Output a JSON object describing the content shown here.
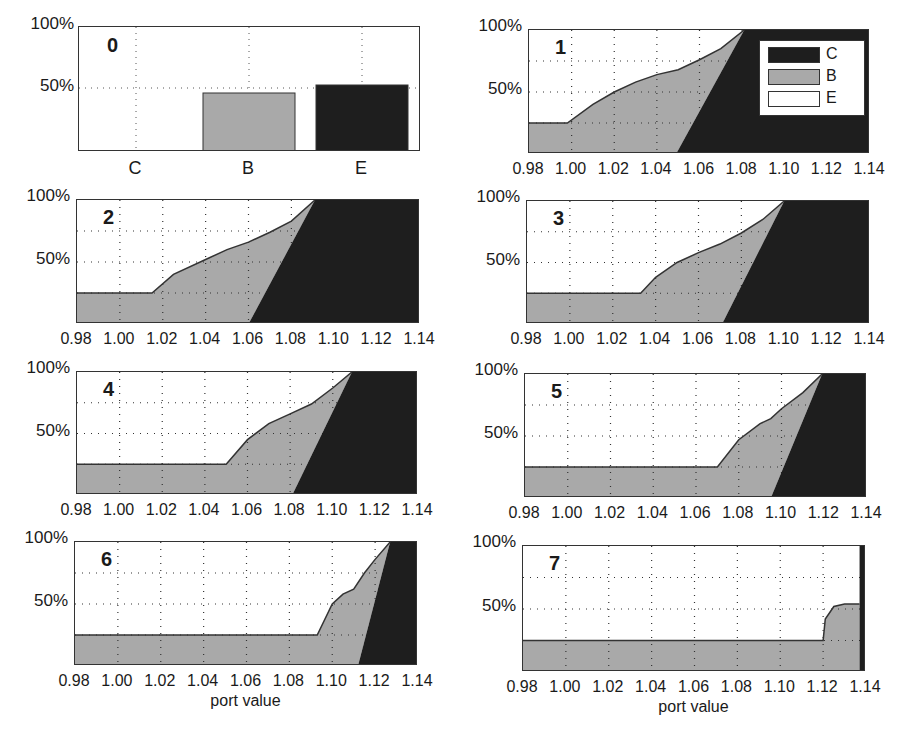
{
  "colors": {
    "C": "#1e1e1e",
    "B": "#a9a9a9",
    "E": "#ffffff",
    "grid": "#333333"
  },
  "y_ticks": [
    "100%",
    "50%"
  ],
  "x_ticks": [
    "0.98",
    "1.00",
    "1.02",
    "1.04",
    "1.06",
    "1.08",
    "1.10",
    "1.12",
    "1.14"
  ],
  "x_axis_label": "port value",
  "legend": [
    {
      "key": "C",
      "label": "C"
    },
    {
      "key": "B",
      "label": "B"
    },
    {
      "key": "E",
      "label": "E"
    }
  ],
  "panels": [
    {
      "id": "0",
      "label": "0"
    },
    {
      "id": "1",
      "label": "1"
    },
    {
      "id": "2",
      "label": "2"
    },
    {
      "id": "3",
      "label": "3"
    },
    {
      "id": "4",
      "label": "4"
    },
    {
      "id": "5",
      "label": "5"
    },
    {
      "id": "6",
      "label": "6"
    },
    {
      "id": "7",
      "label": "7"
    }
  ],
  "chart_data": [
    {
      "panel": "0",
      "type": "bar",
      "title": "0",
      "categories": [
        "C",
        "B",
        "E"
      ],
      "values": [
        0,
        46,
        54
      ],
      "colors": [
        "#1e1e1e",
        "#a9a9a9",
        "#1e1e1e"
      ],
      "ylabel": "",
      "ylim": [
        0,
        100
      ],
      "yticks": [
        "50%",
        "100%"
      ],
      "grid": true
    },
    {
      "panel": "1",
      "type": "area",
      "title": "1",
      "xlim": [
        0.98,
        1.14
      ],
      "ylim": [
        0,
        100
      ],
      "xticks": [
        0.98,
        1.0,
        1.02,
        1.04,
        1.06,
        1.08,
        1.1,
        1.12,
        1.14
      ],
      "yticks": [
        "50%",
        "100%"
      ],
      "series": [
        {
          "name": "B upper (C+B cumulative)",
          "x": [
            0.98,
            0.998,
            1.01,
            1.02,
            1.03,
            1.04,
            1.05,
            1.06,
            1.07,
            1.081
          ],
          "values": [
            25,
            25,
            40,
            50,
            58,
            64,
            68,
            76,
            85,
            100
          ]
        },
        {
          "name": "C boundary",
          "x": [
            1.049,
            1.081
          ],
          "values": [
            0,
            100
          ]
        }
      ],
      "legend": [
        "C",
        "B",
        "E"
      ],
      "legend_position": "upper right",
      "grid": true
    },
    {
      "panel": "2",
      "type": "area",
      "title": "2",
      "xlim": [
        0.98,
        1.14
      ],
      "ylim": [
        0,
        100
      ],
      "series": [
        {
          "name": "B upper",
          "x": [
            0.98,
            1.015,
            1.025,
            1.04,
            1.05,
            1.06,
            1.07,
            1.08,
            1.091
          ],
          "values": [
            25,
            25,
            40,
            52,
            60,
            66,
            74,
            83,
            100
          ]
        },
        {
          "name": "C boundary",
          "x": [
            1.06,
            1.091
          ],
          "values": [
            0,
            100
          ]
        }
      ],
      "grid": true
    },
    {
      "panel": "3",
      "type": "area",
      "title": "3",
      "xlim": [
        0.98,
        1.14
      ],
      "ylim": [
        0,
        100
      ],
      "series": [
        {
          "name": "B upper",
          "x": [
            0.98,
            1.033,
            1.04,
            1.05,
            1.06,
            1.07,
            1.08,
            1.09,
            1.1
          ],
          "values": [
            25,
            25,
            38,
            50,
            58,
            65,
            74,
            85,
            100
          ]
        },
        {
          "name": "C boundary",
          "x": [
            1.071,
            1.1
          ],
          "values": [
            0,
            100
          ]
        }
      ],
      "grid": true
    },
    {
      "panel": "4",
      "type": "area",
      "title": "4",
      "xlim": [
        0.98,
        1.14
      ],
      "ylim": [
        0,
        100
      ],
      "series": [
        {
          "name": "B upper",
          "x": [
            0.98,
            1.05,
            1.06,
            1.07,
            1.08,
            1.09,
            1.1,
            1.109
          ],
          "values": [
            25,
            25,
            45,
            58,
            66,
            74,
            87,
            100
          ]
        },
        {
          "name": "C boundary",
          "x": [
            1.081,
            1.109
          ],
          "values": [
            0,
            100
          ]
        }
      ],
      "grid": true
    },
    {
      "panel": "5",
      "type": "area",
      "title": "5",
      "xlim": [
        0.98,
        1.14
      ],
      "ylim": [
        0,
        100
      ],
      "series": [
        {
          "name": "B upper",
          "x": [
            0.98,
            1.07,
            1.08,
            1.09,
            1.095,
            1.1,
            1.11,
            1.119
          ],
          "values": [
            25,
            25,
            47,
            60,
            64,
            72,
            85,
            100
          ]
        },
        {
          "name": "C boundary",
          "x": [
            1.095,
            1.119
          ],
          "values": [
            0,
            100
          ]
        }
      ],
      "grid": true
    },
    {
      "panel": "6",
      "type": "area",
      "title": "6",
      "xlim": [
        0.98,
        1.14
      ],
      "ylim": [
        0,
        100
      ],
      "series": [
        {
          "name": "B upper",
          "x": [
            0.98,
            1.093,
            1.1,
            1.105,
            1.11,
            1.115,
            1.12,
            1.127
          ],
          "values": [
            25,
            25,
            50,
            58,
            62,
            75,
            86,
            100
          ]
        },
        {
          "name": "C boundary",
          "x": [
            1.112,
            1.127
          ],
          "values": [
            0,
            100
          ]
        }
      ],
      "grid": true
    },
    {
      "panel": "7",
      "type": "area",
      "title": "7",
      "xlim": [
        0.98,
        1.14
      ],
      "ylim": [
        0,
        100
      ],
      "series": [
        {
          "name": "B upper",
          "x": [
            0.98,
            1.12,
            1.121,
            1.125,
            1.13,
            1.137
          ],
          "values": [
            25,
            25,
            42,
            52,
            54,
            54
          ]
        },
        {
          "name": "C boundary",
          "x": [
            1.137,
            1.137
          ],
          "values": [
            0,
            100
          ]
        }
      ],
      "xlabel": "port value",
      "grid": true
    }
  ]
}
